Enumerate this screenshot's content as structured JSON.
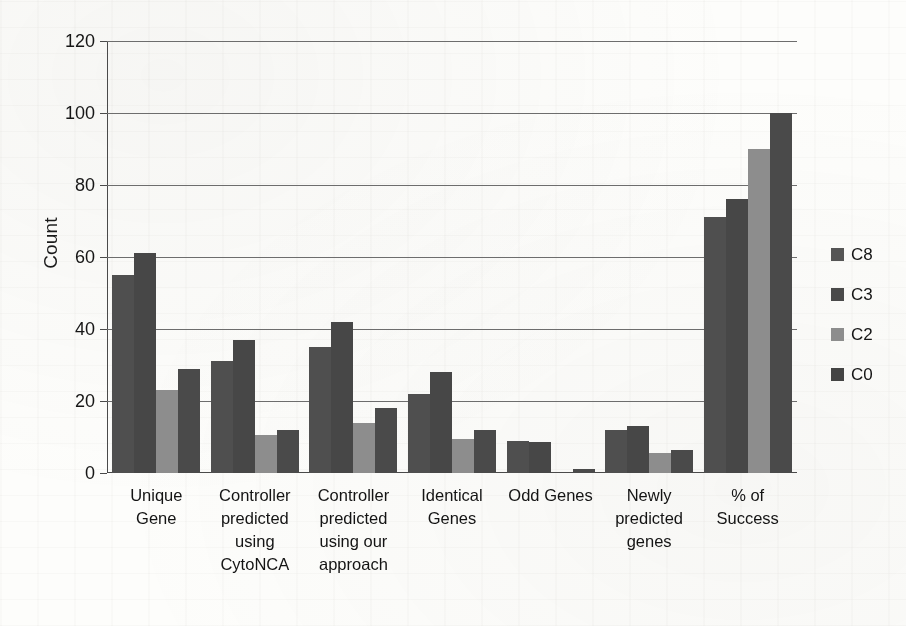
{
  "chart_data": {
    "type": "bar",
    "title": "",
    "xlabel": "",
    "ylabel": "Count",
    "ylim": [
      0,
      120
    ],
    "yticks": [
      0,
      20,
      40,
      60,
      80,
      100,
      120
    ],
    "grid": true,
    "legend_position": "right",
    "categories": [
      "Unique Gene",
      "Controller predicted using CytoNCA",
      "Controller predicted using our approach",
      "Identical Genes",
      "Odd Genes",
      "Newly predicted genes",
      "% of Success"
    ],
    "category_lines": [
      [
        "Unique",
        "Gene"
      ],
      [
        "Controller",
        "predicted",
        "using",
        "CytoNCA"
      ],
      [
        "Controller",
        "predicted",
        "using our",
        "approach"
      ],
      [
        "Identical",
        "Genes"
      ],
      [
        "Odd Genes"
      ],
      [
        "Newly",
        "predicted",
        "genes"
      ],
      [
        "% of",
        "Success"
      ]
    ],
    "series": [
      {
        "name": "C8",
        "color": "#4f4f4f",
        "values": [
          55,
          31,
          35,
          22,
          9,
          12,
          71
        ]
      },
      {
        "name": "C3",
        "color": "#474747",
        "values": [
          61,
          37,
          42,
          28,
          8.5,
          13,
          76
        ]
      },
      {
        "name": "C2",
        "color": "#8d8d8d",
        "values": [
          23,
          10.5,
          14,
          9.5,
          0,
          5.5,
          90
        ]
      },
      {
        "name": "C0",
        "color": "#4a4a4a",
        "values": [
          29,
          12,
          18,
          12,
          1,
          6.5,
          100
        ]
      }
    ]
  },
  "legend": {
    "items": [
      {
        "label": "C8",
        "color": "#555555"
      },
      {
        "label": "C3",
        "color": "#4a4a4a"
      },
      {
        "label": "C2",
        "color": "#8d8d8d"
      },
      {
        "label": "C0",
        "color": "#444444"
      }
    ]
  }
}
